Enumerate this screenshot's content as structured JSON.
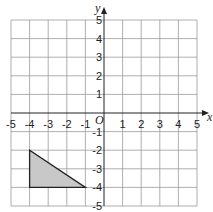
{
  "diagram": {
    "type": "coordinate-grid",
    "x_axis_label": "x",
    "y_axis_label": "y",
    "origin_label": "O",
    "x_range": [
      -5,
      5
    ],
    "y_range": [
      -5,
      5
    ],
    "x_ticks": [
      "-5",
      "-4",
      "-3",
      "-2",
      "-1",
      "1",
      "2",
      "3",
      "4",
      "5"
    ],
    "y_ticks": [
      "5",
      "4",
      "3",
      "2",
      "1",
      "-1",
      "-2",
      "-3",
      "-4",
      "-5"
    ],
    "shape": {
      "name": "triangle",
      "vertices": [
        [
          -4,
          -2
        ],
        [
          -4,
          -4
        ],
        [
          -1,
          -4
        ]
      ],
      "fill": "#c8c8c8",
      "stroke": "#222222"
    },
    "grid_color": "#9a9a9a",
    "axis_color": "#222222"
  }
}
